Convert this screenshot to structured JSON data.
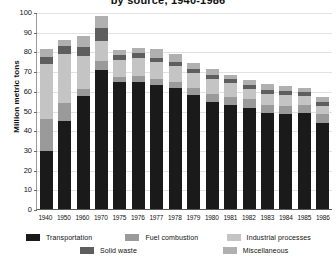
{
  "chart_data": {
    "type": "bar",
    "stacked": true,
    "title_visible": "by source, 1940-1986",
    "xlabel": "",
    "ylabel": "Million metric tons",
    "ylim": [
      0,
      100
    ],
    "yticks": [
      0,
      10,
      20,
      30,
      40,
      50,
      60,
      70,
      80,
      90,
      100
    ],
    "grid": true,
    "legend_position": "bottom",
    "categories": [
      "1940",
      "1950",
      "1960",
      "1970",
      "1975",
      "1976",
      "1977",
      "1978",
      "1979",
      "1980",
      "1981",
      "1982",
      "1983",
      "1984",
      "1985",
      "1986"
    ],
    "series": [
      {
        "name": "Transportation",
        "color": "#1a1a1a",
        "values": [
          29.5,
          44.5,
          57.5,
          70.5,
          64.5,
          64.5,
          63.0,
          61.5,
          58.0,
          54.5,
          53.0,
          51.5,
          48.5,
          48.0,
          48.5,
          43.5
        ]
      },
      {
        "name": "Fuel combustion",
        "color": "#9a9a9a",
        "values": [
          16.0,
          9.5,
          3.5,
          4.5,
          2.5,
          3.0,
          3.0,
          3.0,
          3.5,
          4.0,
          4.0,
          4.5,
          4.5,
          4.5,
          4.5,
          4.5
        ]
      },
      {
        "name": "Industrial processes",
        "color": "#c4c4c4",
        "values": [
          28.0,
          24.5,
          16.5,
          10.5,
          8.5,
          9.0,
          8.5,
          8.0,
          7.5,
          7.5,
          7.0,
          5.0,
          5.5,
          5.5,
          4.5,
          4.5
        ]
      },
      {
        "name": "Solid waste",
        "color": "#5e5e5e",
        "values": [
          3.5,
          4.5,
          5.0,
          6.5,
          2.5,
          2.5,
          2.0,
          2.0,
          2.0,
          2.0,
          2.0,
          2.0,
          2.0,
          2.0,
          2.0,
          2.0
        ]
      },
      {
        "name": "Miscellaneous",
        "color": "#b0b0b0",
        "values": [
          4.0,
          3.0,
          5.5,
          6.0,
          2.5,
          2.5,
          4.5,
          4.0,
          3.0,
          3.0,
          2.0,
          2.5,
          3.0,
          2.5,
          2.0,
          2.5
        ]
      }
    ]
  },
  "legend": {
    "row1": [
      {
        "label": "Transportation",
        "color": "#1a1a1a"
      },
      {
        "label": "Fuel combustion",
        "color": "#9a9a9a"
      },
      {
        "label": "Industrial processes",
        "color": "#c4c4c4"
      }
    ],
    "row2": [
      {
        "label": "Solid waste",
        "color": "#5e5e5e"
      },
      {
        "label": "Miscellaneous",
        "color": "#b0b0b0"
      }
    ]
  }
}
